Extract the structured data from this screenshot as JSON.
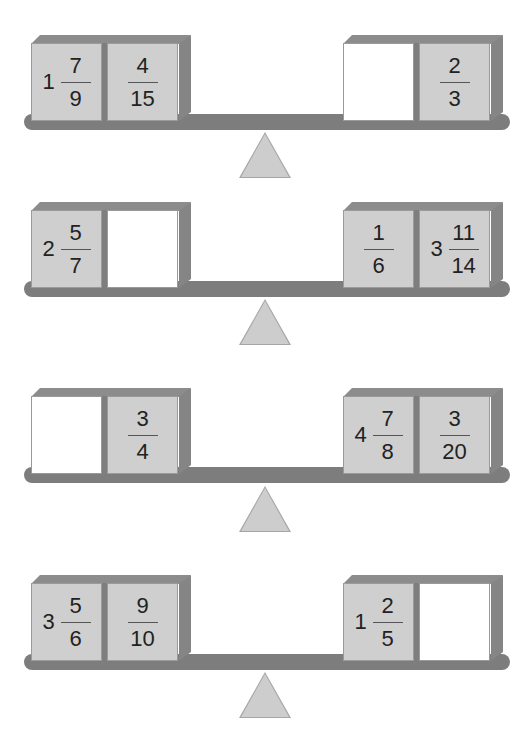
{
  "colors": {
    "box_face": "#cfcfcf",
    "box_edge": "#8c8c8c",
    "beam": "#7d7d7d",
    "fulcrum": "#cdcdcd",
    "blank_box": "#ffffff"
  },
  "seesaws": [
    {
      "left": [
        {
          "whole": "1",
          "numerator": "7",
          "denominator": "9",
          "blank": false
        },
        {
          "whole": "",
          "numerator": "4",
          "denominator": "15",
          "blank": false
        }
      ],
      "right": [
        {
          "whole": "",
          "numerator": "",
          "denominator": "",
          "blank": true
        },
        {
          "whole": "",
          "numerator": "2",
          "denominator": "3",
          "blank": false
        }
      ]
    },
    {
      "left": [
        {
          "whole": "2",
          "numerator": "5",
          "denominator": "7",
          "blank": false
        },
        {
          "whole": "",
          "numerator": "",
          "denominator": "",
          "blank": true
        }
      ],
      "right": [
        {
          "whole": "",
          "numerator": "1",
          "denominator": "6",
          "blank": false
        },
        {
          "whole": "3",
          "numerator": "11",
          "denominator": "14",
          "blank": false
        }
      ]
    },
    {
      "left": [
        {
          "whole": "",
          "numerator": "",
          "denominator": "",
          "blank": true
        },
        {
          "whole": "",
          "numerator": "3",
          "denominator": "4",
          "blank": false
        }
      ],
      "right": [
        {
          "whole": "4",
          "numerator": "7",
          "denominator": "8",
          "blank": false
        },
        {
          "whole": "",
          "numerator": "3",
          "denominator": "20",
          "blank": false
        }
      ]
    },
    {
      "left": [
        {
          "whole": "3",
          "numerator": "5",
          "denominator": "6",
          "blank": false
        },
        {
          "whole": "",
          "numerator": "9",
          "denominator": "10",
          "blank": false
        }
      ],
      "right": [
        {
          "whole": "1",
          "numerator": "2",
          "denominator": "5",
          "blank": false
        },
        {
          "whole": "",
          "numerator": "",
          "denominator": "",
          "blank": true
        }
      ]
    }
  ]
}
